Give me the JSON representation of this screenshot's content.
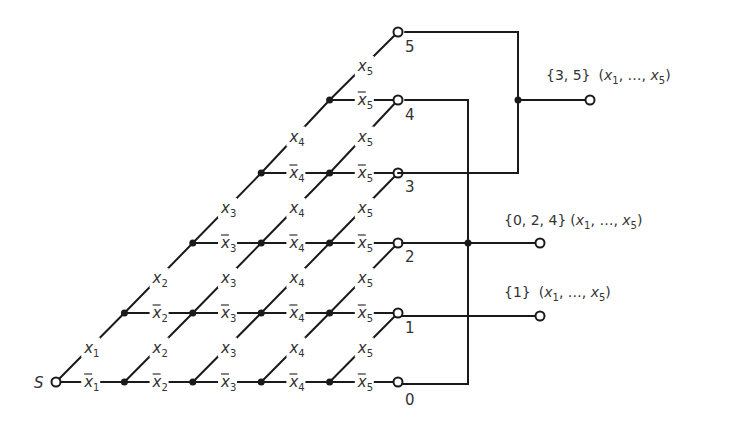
{
  "diagram": {
    "title": "",
    "source_label": "S",
    "variables": [
      "x1",
      "x2",
      "x3",
      "x4",
      "x5"
    ],
    "terminal_labels": [
      "0",
      "1",
      "2",
      "3",
      "4",
      "5"
    ],
    "outputs": [
      {
        "set": "{3, 5}",
        "args": "(x1, ..., x5)",
        "joins_terminals": [
          "3",
          "5"
        ]
      },
      {
        "set": "{0, 2, 4}",
        "args": "(x1, ..., x5)",
        "joins_terminals": [
          "0",
          "2",
          "4"
        ]
      },
      {
        "set": "{1}",
        "args": "(x1, ..., x5)",
        "joins_terminals": [
          "1"
        ]
      }
    ],
    "edge_rule": "Horizontal contacts are negated variables (x̄i), diagonal contacts are positive variables (xi); level counts the number of variables equal to 1",
    "text": {
      "S": "S",
      "t0": "0",
      "t1": "1",
      "t2": "2",
      "t3": "3",
      "t4": "4",
      "t5": "5",
      "out35_set": "{3, 5}",
      "out024_set": "{0, 2, 4}",
      "out1_set": "{1}",
      "args_open": "(",
      "args_x": "x",
      "args_sub1": "1",
      "args_mid": ", …, ",
      "args_sub5": "5",
      "args_close": ")",
      "x": "x"
    }
  }
}
